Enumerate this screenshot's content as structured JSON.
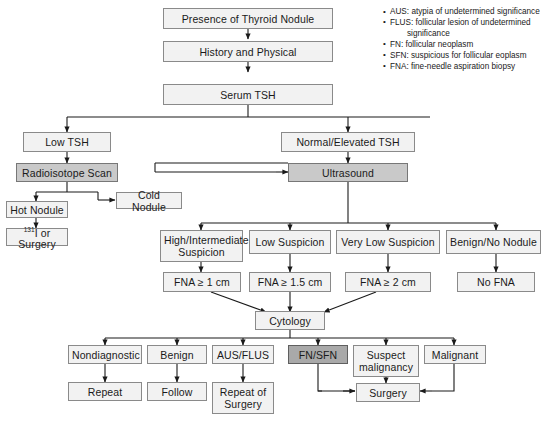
{
  "figure": {
    "colors": {
      "box_fill_light": "#f2f2f2",
      "box_fill_mid": "#c9c9c9",
      "box_fill_dark": "#a9a9a9",
      "box_border": "#8a8a8a",
      "line": "#1a1a1a",
      "text": "#1a1a1a"
    }
  },
  "legend": {
    "items": [
      "AUS: atypia of undetermined significance",
      "FLUS: follicular lesion of undetermined",
      "significance",
      "FN: follicular neoplasm",
      "SFN: suspicious for follicular  eoplasm",
      "FNA: fine-needle aspiration biopsy"
    ],
    "continuation_indices": [
      2
    ]
  },
  "nodes": {
    "presence": "Presence of Thyroid Nodule",
    "history": "History and Physical",
    "serum_tsh": "Serum TSH",
    "low_tsh": "Low TSH",
    "normal_elevated_tsh": "Normal/Elevated TSH",
    "radioisotope": "Radioisotope Scan",
    "ultrasound": "Ultrasound",
    "hot_nodule": "Hot Nodule",
    "cold_nodule": "Cold Nodule",
    "i131_or_surgery_prefix": "131",
    "i131_or_surgery_suffix": "I or Surgery",
    "high_intermediate": "High/Intermediate Suspicion",
    "low_suspicion": "Low Suspicion",
    "very_low_suspicion": "Very Low Suspicion",
    "benign_no_nodule": "Benign/No Nodule",
    "fna_1cm": "FNA ≥ 1 cm",
    "fna_15cm": "FNA ≥ 1.5 cm",
    "fna_2cm": "FNA ≥ 2 cm",
    "no_fna": "No FNA",
    "cytology": "Cytology",
    "nondiagnostic": "Nondiagnostic",
    "benign": "Benign",
    "aus_flus": "AUS/FLUS",
    "fn_sfn": "FN/SFN",
    "suspect_malignancy": "Suspect malignancy",
    "malignant": "Malignant",
    "repeat": "Repeat",
    "follow": "Follow",
    "repeat_of_surgery": "Repeat of Surgery",
    "surgery": "Surgery"
  }
}
